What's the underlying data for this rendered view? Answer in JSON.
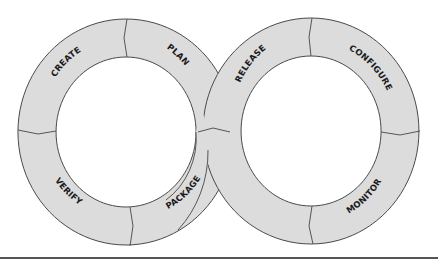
{
  "diagram": {
    "type": "infinity-loop",
    "fill_color": "#dcdcdc",
    "stroke_color": "#4a4a4a",
    "left_loop": {
      "stages": [
        {
          "label": "PLAN"
        },
        {
          "label": "CREATE"
        },
        {
          "label": "VERIFY"
        },
        {
          "label": "PACKAGE"
        }
      ]
    },
    "right_loop": {
      "stages": [
        {
          "label": "RELEASE"
        },
        {
          "label": "CONFIGURE"
        },
        {
          "label": "MONITOR"
        }
      ]
    }
  }
}
